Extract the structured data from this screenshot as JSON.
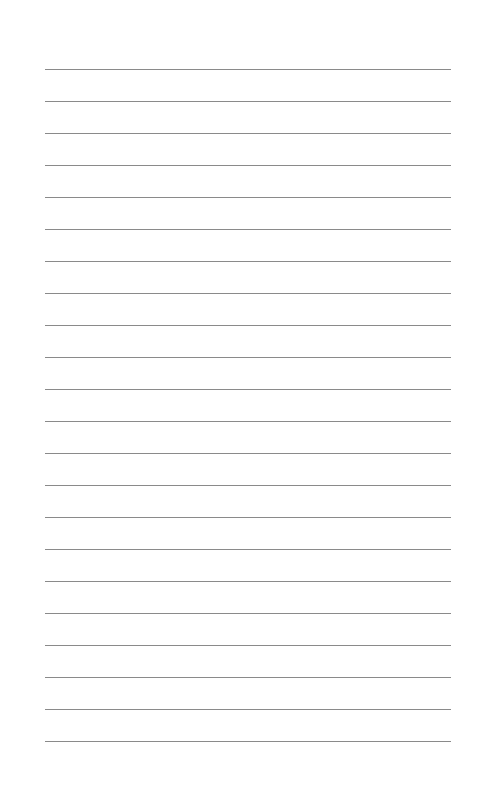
{
  "page": {
    "type": "lined-paper",
    "background_color": "#ffffff",
    "line_color": "#8a8a8a",
    "line_count": 22,
    "first_line_y": 69,
    "line_spacing": 32,
    "line_left": 45,
    "line_width": 406,
    "text": []
  }
}
